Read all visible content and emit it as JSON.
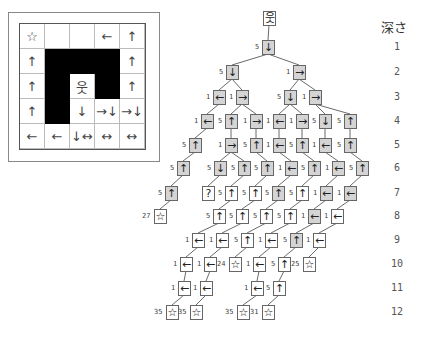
{
  "depth_header": "深さ",
  "depth_labels": [
    {
      "text": "1",
      "y": 47
    },
    {
      "text": "2",
      "y": 72
    },
    {
      "text": "3",
      "y": 97
    },
    {
      "text": "4",
      "y": 121
    },
    {
      "text": "5",
      "y": 145
    },
    {
      "text": "6",
      "y": 168
    },
    {
      "text": "7",
      "y": 193
    },
    {
      "text": "8",
      "y": 216
    },
    {
      "text": "9",
      "y": 240
    },
    {
      "text": "10",
      "y": 264
    },
    {
      "text": "11",
      "y": 288
    },
    {
      "text": "12",
      "y": 312
    }
  ],
  "grid": {
    "rows": 5,
    "cols": 5,
    "walls": [
      [
        1,
        1
      ],
      [
        1,
        2
      ],
      [
        1,
        3
      ],
      [
        2,
        1
      ],
      [
        2,
        3
      ],
      [
        3,
        1
      ]
    ],
    "cells": [
      {
        "r": 0,
        "c": 0,
        "glyph": "☆"
      },
      {
        "r": 0,
        "c": 3,
        "glyph": "←"
      },
      {
        "r": 0,
        "c": 4,
        "glyph": "↑"
      },
      {
        "r": 1,
        "c": 0,
        "glyph": "↑"
      },
      {
        "r": 1,
        "c": 4,
        "glyph": "↑"
      },
      {
        "r": 2,
        "c": 0,
        "glyph": "↑"
      },
      {
        "r": 2,
        "c": 2,
        "glyph": "웃"
      },
      {
        "r": 2,
        "c": 4,
        "glyph": "↑"
      },
      {
        "r": 3,
        "c": 0,
        "glyph": "↑"
      },
      {
        "r": 3,
        "c": 2,
        "glyph": "↓"
      },
      {
        "r": 3,
        "c": 3,
        "glyph": "→↓"
      },
      {
        "r": 3,
        "c": 4,
        "glyph": "→↓"
      },
      {
        "r": 4,
        "c": 0,
        "glyph": "←"
      },
      {
        "r": 4,
        "c": 1,
        "glyph": "←"
      },
      {
        "r": 4,
        "c": 2,
        "glyph": "↓↔"
      },
      {
        "r": 4,
        "c": 3,
        "glyph": "↔"
      },
      {
        "r": 4,
        "c": 4,
        "glyph": "↔"
      }
    ]
  },
  "tree": {
    "nodes": [
      {
        "id": "root",
        "x": 269,
        "y": 18,
        "glyph": "웃",
        "cost": "",
        "white": true
      },
      {
        "id": "d1a",
        "x": 268,
        "y": 47,
        "glyph": "↓",
        "cost": "5",
        "parent": "root"
      },
      {
        "id": "d2a",
        "x": 232,
        "y": 72,
        "glyph": "↓",
        "cost": "5",
        "parent": "d1a"
      },
      {
        "id": "d2b",
        "x": 299,
        "y": 72,
        "glyph": "→",
        "cost": "1",
        "parent": "d1a"
      },
      {
        "id": "d3a",
        "x": 219,
        "y": 97,
        "glyph": "←",
        "cost": "1",
        "parent": "d2a"
      },
      {
        "id": "d3b",
        "x": 242,
        "y": 97,
        "glyph": "→",
        "cost": "1",
        "parent": "d2a"
      },
      {
        "id": "d3c",
        "x": 290,
        "y": 97,
        "glyph": "↓",
        "cost": "5",
        "parent": "d2b"
      },
      {
        "id": "d3d",
        "x": 315,
        "y": 97,
        "glyph": "→",
        "cost": "1",
        "parent": "d2b"
      },
      {
        "id": "d4a",
        "x": 207,
        "y": 121,
        "glyph": "←",
        "cost": "1",
        "parent": "d3a"
      },
      {
        "id": "d4b",
        "x": 231,
        "y": 121,
        "glyph": "↑",
        "cost": "5",
        "parent": "d3b"
      },
      {
        "id": "d4c",
        "x": 256,
        "y": 121,
        "glyph": "→",
        "cost": "1",
        "parent": "d3b"
      },
      {
        "id": "d4d",
        "x": 279,
        "y": 121,
        "glyph": "←",
        "cost": "1",
        "parent": "d3c"
      },
      {
        "id": "d4e",
        "x": 302,
        "y": 121,
        "glyph": "→",
        "cost": "1",
        "parent": "d3c"
      },
      {
        "id": "d4f",
        "x": 325,
        "y": 121,
        "glyph": "↓",
        "cost": "5",
        "parent": "d3d"
      },
      {
        "id": "d4g",
        "x": 350,
        "y": 121,
        "glyph": "↑",
        "cost": "5",
        "parent": "d3d"
      },
      {
        "id": "d5a",
        "x": 195,
        "y": 145,
        "glyph": "↑",
        "cost": "5",
        "parent": "d4a"
      },
      {
        "id": "d5b",
        "x": 231,
        "y": 145,
        "glyph": "→",
        "cost": "1",
        "parent": "d4b"
      },
      {
        "id": "d5c",
        "x": 256,
        "y": 145,
        "glyph": "↑",
        "cost": "5",
        "parent": "d4c"
      },
      {
        "id": "d5d",
        "x": 279,
        "y": 145,
        "glyph": "←",
        "cost": "1",
        "parent": "d4d"
      },
      {
        "id": "d5e",
        "x": 302,
        "y": 145,
        "glyph": "↑",
        "cost": "5",
        "parent": "d4e"
      },
      {
        "id": "d5f",
        "x": 325,
        "y": 145,
        "glyph": "←",
        "cost": "1",
        "parent": "d4f"
      },
      {
        "id": "d5g",
        "x": 350,
        "y": 145,
        "glyph": "↑",
        "cost": "5",
        "parent": "d4g"
      },
      {
        "id": "d6a",
        "x": 183,
        "y": 168,
        "glyph": "↑",
        "cost": "5",
        "parent": "d5a"
      },
      {
        "id": "d6b",
        "x": 220,
        "y": 168,
        "glyph": "↓",
        "cost": "5",
        "parent": "d5b"
      },
      {
        "id": "d6c",
        "x": 244,
        "y": 168,
        "glyph": "↑",
        "cost": "5",
        "parent": "d5b"
      },
      {
        "id": "d6d",
        "x": 267,
        "y": 168,
        "glyph": "↑",
        "cost": "5",
        "parent": "d5c"
      },
      {
        "id": "d6e",
        "x": 291,
        "y": 168,
        "glyph": "←",
        "cost": "1",
        "parent": "d5d"
      },
      {
        "id": "d6f",
        "x": 314,
        "y": 168,
        "glyph": "↑",
        "cost": "5",
        "parent": "d5e"
      },
      {
        "id": "d6g",
        "x": 338,
        "y": 168,
        "glyph": "←",
        "cost": "1",
        "parent": "d5f"
      },
      {
        "id": "d6h",
        "x": 362,
        "y": 168,
        "glyph": "↑",
        "cost": "5",
        "parent": "d5g"
      },
      {
        "id": "d7a",
        "x": 171,
        "y": 193,
        "glyph": "↑",
        "cost": "5",
        "parent": "d6a"
      },
      {
        "id": "d7b",
        "x": 208,
        "y": 193,
        "glyph": "?",
        "cost": "",
        "white": true,
        "parent": "d6b"
      },
      {
        "id": "d7c",
        "x": 231,
        "y": 193,
        "glyph": "↑",
        "cost": "5",
        "white": true,
        "parent": "d6c"
      },
      {
        "id": "d7d",
        "x": 255,
        "y": 193,
        "glyph": "↑",
        "cost": "5",
        "white": true,
        "parent": "d6d"
      },
      {
        "id": "d7e",
        "x": 278,
        "y": 193,
        "glyph": "↑",
        "cost": "5",
        "parent": "d6e"
      },
      {
        "id": "d7f",
        "x": 302,
        "y": 193,
        "glyph": "↑",
        "cost": "5",
        "white": true,
        "parent": "d6f"
      },
      {
        "id": "d7g",
        "x": 326,
        "y": 193,
        "glyph": "←",
        "cost": "1",
        "parent": "d6g"
      },
      {
        "id": "d7h",
        "x": 350,
        "y": 193,
        "glyph": "←",
        "cost": "1",
        "parent": "d6h"
      },
      {
        "id": "d8a",
        "x": 160,
        "y": 216,
        "glyph": "☆",
        "cost": "27",
        "white": true,
        "parent": "d7a"
      },
      {
        "id": "d8b",
        "x": 219,
        "y": 216,
        "glyph": "↑",
        "cost": "5",
        "white": true,
        "parent": "d7c"
      },
      {
        "id": "d8c",
        "x": 242,
        "y": 216,
        "glyph": "↑",
        "cost": "5",
        "white": true,
        "parent": "d7d"
      },
      {
        "id": "d8d",
        "x": 266,
        "y": 216,
        "glyph": "↑",
        "cost": "5",
        "white": true,
        "parent": "d7e"
      },
      {
        "id": "d8e",
        "x": 290,
        "y": 216,
        "glyph": "↑",
        "cost": "5",
        "white": true,
        "parent": "d7f"
      },
      {
        "id": "d8f",
        "x": 314,
        "y": 216,
        "glyph": "←",
        "cost": "1",
        "parent": "d7g"
      },
      {
        "id": "d8g",
        "x": 337,
        "y": 216,
        "glyph": "←",
        "cost": "1",
        "white": true,
        "parent": "d7h"
      },
      {
        "id": "d9a",
        "x": 198,
        "y": 240,
        "glyph": "←",
        "cost": "1",
        "white": true,
        "parent": "d8b"
      },
      {
        "id": "d9b",
        "x": 222,
        "y": 240,
        "glyph": "←",
        "cost": "1",
        "white": true,
        "parent": "d8c"
      },
      {
        "id": "d9c",
        "x": 247,
        "y": 240,
        "glyph": "↑",
        "cost": "5",
        "white": true,
        "parent": "d8d"
      },
      {
        "id": "d9d",
        "x": 271,
        "y": 240,
        "glyph": "←",
        "cost": "1",
        "white": true,
        "parent": "d8e"
      },
      {
        "id": "d9e",
        "x": 296,
        "y": 240,
        "glyph": "↑",
        "cost": "5",
        "parent": "d8f"
      },
      {
        "id": "d9f",
        "x": 319,
        "y": 240,
        "glyph": "←",
        "cost": "1",
        "white": true,
        "parent": "d8g"
      },
      {
        "id": "d10a",
        "x": 186,
        "y": 264,
        "glyph": "←",
        "cost": "1",
        "white": true,
        "parent": "d9a"
      },
      {
        "id": "d10b",
        "x": 210,
        "y": 264,
        "glyph": "←",
        "cost": "1",
        "white": true,
        "parent": "d9b"
      },
      {
        "id": "d10c",
        "x": 235,
        "y": 264,
        "glyph": "☆",
        "cost": "24",
        "white": true,
        "parent": "d9c"
      },
      {
        "id": "d10d",
        "x": 259,
        "y": 264,
        "glyph": "←",
        "cost": "1",
        "white": true,
        "parent": "d9d"
      },
      {
        "id": "d10e",
        "x": 284,
        "y": 264,
        "glyph": "↑",
        "cost": "5",
        "white": true,
        "parent": "d9e"
      },
      {
        "id": "d10f",
        "x": 309,
        "y": 264,
        "glyph": "☆",
        "cost": "25",
        "white": true,
        "parent": "d9f"
      },
      {
        "id": "d11a",
        "x": 184,
        "y": 288,
        "glyph": "←",
        "cost": "1",
        "white": true,
        "parent": "d10a"
      },
      {
        "id": "d11b",
        "x": 206,
        "y": 288,
        "glyph": "←",
        "cost": "1",
        "white": true,
        "parent": "d10b"
      },
      {
        "id": "d11c",
        "x": 257,
        "y": 288,
        "glyph": "←",
        "cost": "1",
        "white": true,
        "parent": "d10d"
      },
      {
        "id": "d11d",
        "x": 279,
        "y": 288,
        "glyph": "↑",
        "cost": "5",
        "white": true,
        "parent": "d10e"
      },
      {
        "id": "d12a",
        "x": 172,
        "y": 312,
        "glyph": "☆",
        "cost": "35",
        "white": true,
        "parent": "d11a"
      },
      {
        "id": "d12b",
        "x": 196,
        "y": 312,
        "glyph": "☆",
        "cost": "35",
        "white": true,
        "parent": "d11b"
      },
      {
        "id": "d12c",
        "x": 243,
        "y": 312,
        "glyph": "☆",
        "cost": "35",
        "white": true,
        "parent": "d11c"
      },
      {
        "id": "d12d",
        "x": 268,
        "y": 312,
        "glyph": "☆",
        "cost": "31",
        "white": true,
        "parent": "d11d"
      }
    ]
  }
}
